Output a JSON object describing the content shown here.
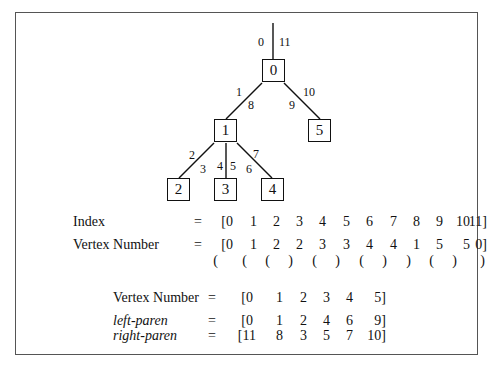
{
  "tree": {
    "nodes": [
      {
        "id": "0",
        "label": "0",
        "x": 262,
        "y": 59
      },
      {
        "id": "1",
        "label": "1",
        "x": 214,
        "y": 119
      },
      {
        "id": "5",
        "label": "5",
        "x": 308,
        "y": 119
      },
      {
        "id": "2",
        "label": "2",
        "x": 167,
        "y": 178
      },
      {
        "id": "3",
        "label": "3",
        "x": 214,
        "y": 178
      },
      {
        "id": "4",
        "label": "4",
        "x": 261,
        "y": 178
      }
    ],
    "edges": [
      {
        "from": "root",
        "to": "0",
        "labels": [
          "0",
          "11"
        ]
      },
      {
        "from": "0",
        "to": "1",
        "labels": [
          "1",
          "8"
        ]
      },
      {
        "from": "0",
        "to": "5",
        "labels": [
          "9",
          "10"
        ]
      },
      {
        "from": "1",
        "to": "2",
        "labels": [
          "2",
          "3"
        ]
      },
      {
        "from": "1",
        "to": "3",
        "labels": [
          "4",
          "5"
        ]
      },
      {
        "from": "1",
        "to": "4",
        "labels": [
          "6",
          "7"
        ]
      }
    ],
    "edge_labels": [
      {
        "text": "0",
        "x": 258,
        "y": 36
      },
      {
        "text": "11",
        "x": 279,
        "y": 36
      },
      {
        "text": "1",
        "x": 236,
        "y": 86
      },
      {
        "text": "8",
        "x": 248,
        "y": 99
      },
      {
        "text": "9",
        "x": 289,
        "y": 99
      },
      {
        "text": "10",
        "x": 303,
        "y": 86
      },
      {
        "text": "2",
        "x": 189,
        "y": 149
      },
      {
        "text": "3",
        "x": 200,
        "y": 163
      },
      {
        "text": "4",
        "x": 217,
        "y": 160
      },
      {
        "text": "5",
        "x": 230,
        "y": 160
      },
      {
        "text": "6",
        "x": 246,
        "y": 163
      },
      {
        "text": "7",
        "x": 253,
        "y": 148
      }
    ]
  },
  "euler_tour": {
    "index_label": "Index",
    "index_eq": "=",
    "index_values": [
      "[0",
      "1",
      "2",
      "3",
      "4",
      "5",
      "6",
      "7",
      "8",
      "9",
      "10",
      "11]"
    ],
    "vertex_label": "Vertex Number",
    "vertex_eq": "=",
    "vertex_values": [
      "[0",
      "1",
      "2",
      "2",
      "3",
      "3",
      "4",
      "4",
      "1",
      "5",
      "5",
      "0]"
    ],
    "parens": [
      "(",
      "(",
      "(",
      ")",
      "(",
      ")",
      "(",
      ")",
      ")",
      "(",
      ")",
      ")"
    ]
  },
  "summary": {
    "vertex_label": "Vertex Number",
    "vertex_eq": "=",
    "vertex_values": [
      "[0",
      "1",
      "2",
      "3",
      "4",
      "5]"
    ],
    "left_label": "left-paren",
    "left_eq": "=",
    "left_values": [
      "[0",
      "1",
      "2",
      "4",
      "6",
      "9]"
    ],
    "right_label": "right-paren",
    "right_eq": "=",
    "right_values": [
      "[11",
      "8",
      "3",
      "5",
      "7",
      "10]"
    ]
  }
}
